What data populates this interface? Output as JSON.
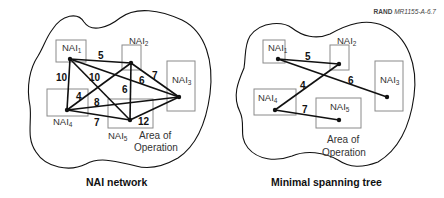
{
  "source_label": {
    "org": "RAND",
    "id": "MR1155-A-6.7"
  },
  "nodes": {
    "nai1": {
      "base": "NAI",
      "sub": "1"
    },
    "nai2": {
      "base": "NAI",
      "sub": "2"
    },
    "nai3": {
      "base": "NAI",
      "sub": "3"
    },
    "nai4": {
      "base": "NAI",
      "sub": "4"
    },
    "nai5": {
      "base": "NAI",
      "sub": "5"
    }
  },
  "area_label": {
    "line1": "Area of",
    "line2": "Operation"
  },
  "network": {
    "caption": "NAI network",
    "edges": [
      {
        "from": "NAI1",
        "to": "NAI2",
        "weight": "5"
      },
      {
        "from": "NAI1",
        "to": "NAI4",
        "weight": "10"
      },
      {
        "from": "NAI1",
        "to": "NAI5",
        "weight": "10"
      },
      {
        "from": "NAI1",
        "to": "NAI3",
        "weight": "6"
      },
      {
        "from": "NAI2",
        "to": "NAI3",
        "weight": "7"
      },
      {
        "from": "NAI2",
        "to": "NAI5",
        "weight": "6"
      },
      {
        "from": "NAI2",
        "to": "NAI4",
        "weight": "4"
      },
      {
        "from": "NAI4",
        "to": "NAI3",
        "weight": "8"
      },
      {
        "from": "NAI4",
        "to": "NAI5",
        "weight": "7"
      },
      {
        "from": "NAI5",
        "to": "NAI3",
        "weight": "12"
      }
    ]
  },
  "tree": {
    "caption": "Minimal spanning tree",
    "edges": [
      {
        "from": "NAI1",
        "to": "NAI2",
        "weight": "5"
      },
      {
        "from": "NAI1",
        "to": "NAI3",
        "weight": "6"
      },
      {
        "from": "NAI2",
        "to": "NAI4",
        "weight": "4"
      },
      {
        "from": "NAI4",
        "to": "NAI5",
        "weight": "7"
      }
    ]
  }
}
